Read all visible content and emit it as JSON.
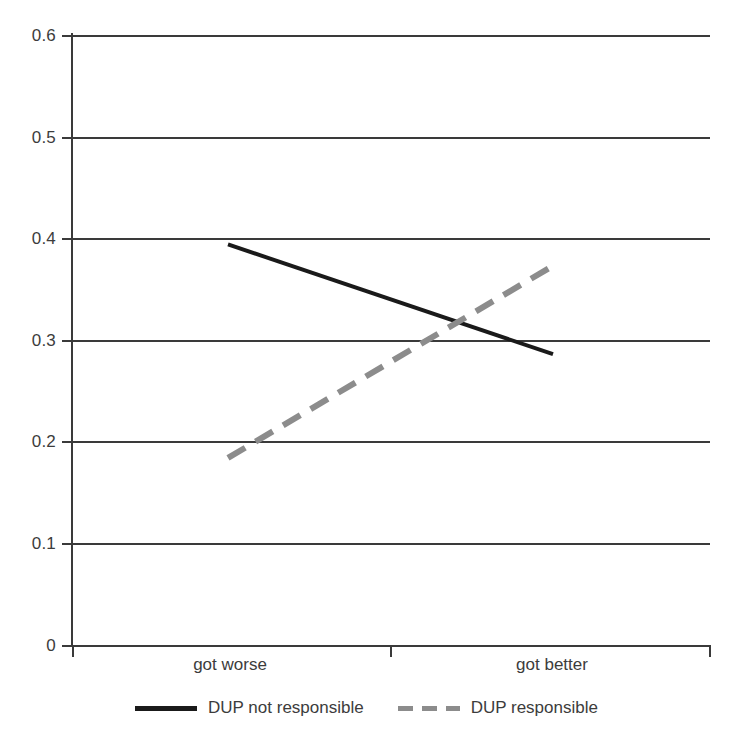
{
  "chart_data": {
    "type": "line",
    "title": "",
    "subtitle": "",
    "xlabel": "",
    "ylabel": "",
    "categories": [
      "got worse",
      "got better"
    ],
    "series": [
      {
        "name": "DUP not responsible",
        "values": [
          0.394,
          0.286
        ],
        "style": "solid",
        "color": "#1a1a1a"
      },
      {
        "name": "DUP responsible",
        "values": [
          0.184,
          0.373
        ],
        "style": "dashed",
        "color": "#8c8c8c"
      }
    ],
    "ylim": [
      0,
      0.6
    ],
    "ytick_values": [
      0.6,
      0.5,
      0.4,
      0.3,
      0.2,
      0.1,
      0
    ],
    "ytick_labels": [
      "0.6",
      "0.5",
      "0.4",
      "0.3",
      "0.2",
      "0.1",
      "0"
    ],
    "grid": true,
    "grid_axis": "y",
    "legend_position": "bottom",
    "axis_color": "#3a3a3a"
  },
  "axes": {
    "y_ticks": [
      {
        "label": "0.6",
        "value": 0.6
      },
      {
        "label": "0.5",
        "value": 0.5
      },
      {
        "label": "0.4",
        "value": 0.4
      },
      {
        "label": "0.3",
        "value": 0.3
      },
      {
        "label": "0.2",
        "value": 0.2
      },
      {
        "label": "0.1",
        "value": 0.1
      },
      {
        "label": "0",
        "value": 0
      }
    ],
    "x_ticks": [
      {
        "label": "got worse"
      },
      {
        "label": ""
      },
      {
        "label": "got better"
      }
    ]
  },
  "legend": {
    "items": [
      {
        "label": "DUP not responsible",
        "style": "solid",
        "color": "#1a1a1a"
      },
      {
        "label": "DUP responsible",
        "style": "dashed",
        "color": "#8c8c8c"
      }
    ]
  }
}
